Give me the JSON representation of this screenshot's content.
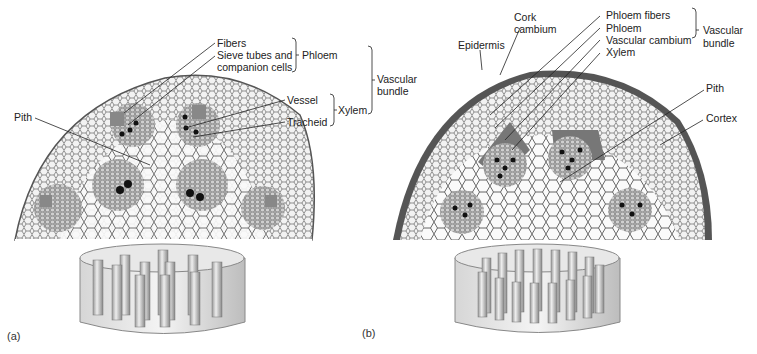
{
  "panel_a": {
    "letter": "(a)",
    "labels": {
      "fibers": "Fibers",
      "sieve_line1": "Sieve tubes and",
      "sieve_line2": "companion cells",
      "phloem": "Phloem",
      "vascular_line1": "Vascular",
      "vascular_line2": "bundle",
      "vessel": "Vessel",
      "tracheid": "Tracheid",
      "xylem": "Xylem",
      "pith": "Pith"
    }
  },
  "panel_b": {
    "letter": "(b)",
    "labels": {
      "cork_line1": "Cork",
      "cork_line2": "cambium",
      "epidermis": "Epidermis",
      "phloem_fibers": "Phloem fibers",
      "phloem": "Phloem",
      "vascular_cambium": "Vascular cambium",
      "xylem": "Xylem",
      "vascular_line1": "Vascular",
      "vascular_line2": "bundle",
      "pith": "Pith",
      "cortex": "Cortex"
    }
  },
  "colors": {
    "tissue_gray": "#b8b8b8",
    "cell_line": "#555555",
    "phloem_dark": "#707070",
    "xylem_black": "#111111"
  }
}
